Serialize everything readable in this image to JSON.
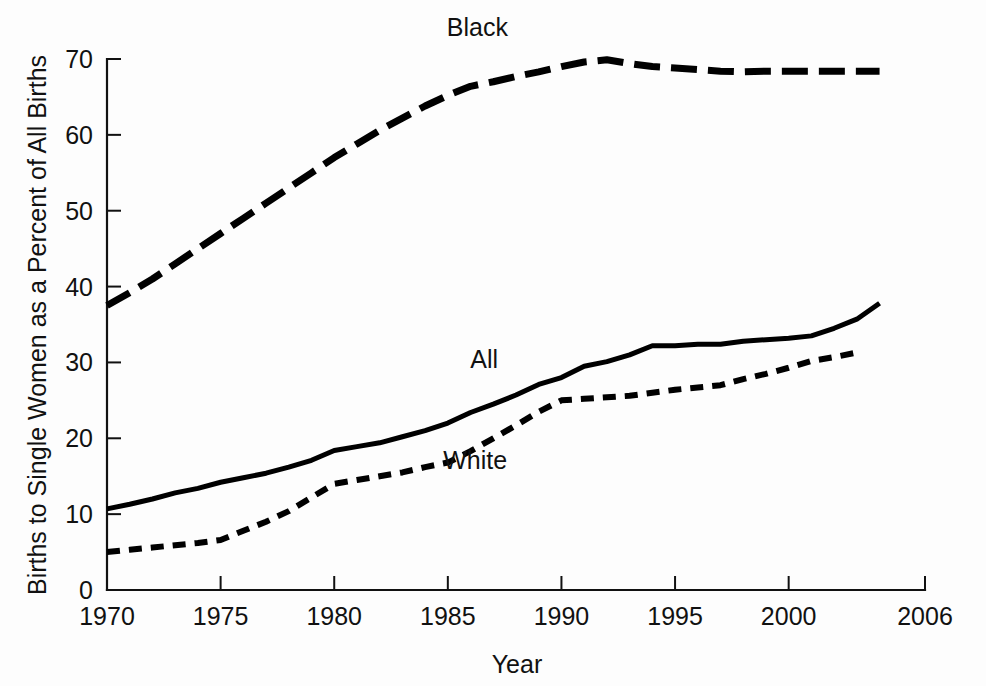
{
  "chart_data": {
    "type": "line",
    "title": "",
    "xlabel": "Year",
    "ylabel": "Births to Single Women as a Percent of All Births",
    "xlim": [
      1970,
      2006
    ],
    "ylim": [
      0,
      70
    ],
    "xticks": [
      "1970",
      "1975",
      "1980",
      "1985",
      "1990",
      "1995",
      "2000",
      "2006"
    ],
    "xtick_values": [
      1970,
      1975,
      1980,
      1985,
      1990,
      1995,
      2000,
      2006
    ],
    "yticks": [
      "0",
      "10",
      "20",
      "30",
      "40",
      "50",
      "60",
      "70"
    ],
    "ytick_values": [
      0,
      10,
      20,
      30,
      40,
      50,
      60,
      70
    ],
    "grid": false,
    "legend_position": "inline-annotations",
    "series": [
      {
        "name": "Black",
        "style": "long-dashed",
        "color": "#000000",
        "label_x": 1986.3,
        "label_y": 73.0,
        "x": [
          1970,
          1971,
          1972,
          1973,
          1974,
          1975,
          1976,
          1977,
          1978,
          1979,
          1980,
          1981,
          1982,
          1983,
          1984,
          1985,
          1986,
          1987,
          1988,
          1989,
          1990,
          1991,
          1992,
          1993,
          1994,
          1995,
          1996,
          1997,
          1998,
          1999,
          2000,
          2001,
          2002,
          2003,
          2004
        ],
        "values": [
          37.5,
          39.2,
          41.0,
          43.0,
          45.0,
          47.0,
          49.0,
          51.0,
          53.0,
          55.0,
          57.0,
          58.8,
          60.6,
          62.2,
          63.8,
          65.2,
          66.4,
          67.0,
          67.7,
          68.3,
          69.0,
          69.6,
          69.9,
          69.4,
          69.0,
          68.8,
          68.6,
          68.4,
          68.3,
          68.4,
          68.4,
          68.4,
          68.4,
          68.4,
          68.4
        ]
      },
      {
        "name": "All",
        "style": "solid",
        "color": "#000000",
        "label_x": 1986.6,
        "label_y": 29.2,
        "x": [
          1970,
          1971,
          1972,
          1973,
          1974,
          1975,
          1976,
          1977,
          1978,
          1979,
          1980,
          1981,
          1982,
          1983,
          1984,
          1985,
          1986,
          1987,
          1988,
          1989,
          1990,
          1991,
          1992,
          1993,
          1994,
          1995,
          1996,
          1997,
          1998,
          1999,
          2000,
          2001,
          2002,
          2003,
          2004
        ],
        "values": [
          10.7,
          11.3,
          12.0,
          12.8,
          13.4,
          14.2,
          14.8,
          15.4,
          16.2,
          17.1,
          18.4,
          18.9,
          19.4,
          20.2,
          21.0,
          22.0,
          23.4,
          24.5,
          25.7,
          27.1,
          28.0,
          29.5,
          30.1,
          31.0,
          32.2,
          32.2,
          32.4,
          32.4,
          32.8,
          33.0,
          33.2,
          33.5,
          34.5,
          35.7,
          37.8
        ]
      },
      {
        "name": "White",
        "style": "short-dashed",
        "color": "#000000",
        "label_x": 1986.2,
        "label_y": 16.0,
        "x": [
          1970,
          1971,
          1972,
          1973,
          1974,
          1975,
          1976,
          1977,
          1978,
          1979,
          1980,
          1981,
          1982,
          1983,
          1984,
          1985,
          1986,
          1987,
          1988,
          1989,
          1990,
          1991,
          1992,
          1993,
          1994,
          1995,
          1996,
          1997,
          1998,
          1999,
          2000,
          2001,
          2002,
          2003
        ],
        "values": [
          5.0,
          5.3,
          5.6,
          5.9,
          6.2,
          6.6,
          7.8,
          9.0,
          10.4,
          12.2,
          14.0,
          14.5,
          15.0,
          15.5,
          16.2,
          16.8,
          18.3,
          20.0,
          21.7,
          23.5,
          25.0,
          25.2,
          25.4,
          25.6,
          26.0,
          26.4,
          26.7,
          27.0,
          27.8,
          28.5,
          29.3,
          30.2,
          30.7,
          31.3
        ]
      }
    ]
  },
  "axes": {
    "y_axis_title": "Births to Single Women as a Percent of All Births",
    "x_axis_title": "Year"
  }
}
